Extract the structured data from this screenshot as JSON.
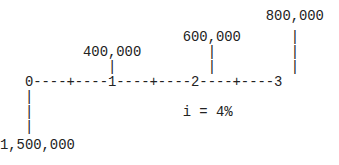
{
  "diagram": {
    "type": "cash-flow-diagram",
    "interest_rate_label": "i = 4%",
    "periods": [
      "0",
      "1",
      "2",
      "3"
    ],
    "cash_flows": [
      {
        "period": 0,
        "amount": "1,500,000",
        "direction": "down"
      },
      {
        "period": 1,
        "amount": "400,000",
        "direction": "up"
      },
      {
        "period": 2,
        "amount": "600,000",
        "direction": "up"
      },
      {
        "period": 3,
        "amount": "800,000",
        "direction": "up"
      }
    ],
    "rows": [
      "                                800,000",
      "                      600,000      |",
      "          400,000        |         |",
      "             |           |         |",
      "   0----+----1----+----2----+----3",
      "   |",
      "   |                  i = 4%",
      "   |",
      "1,500,000"
    ]
  }
}
